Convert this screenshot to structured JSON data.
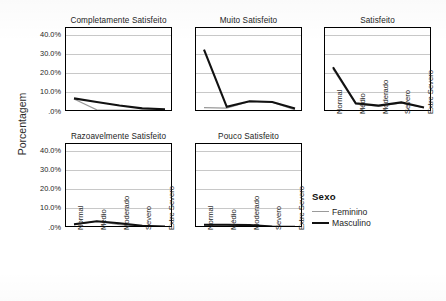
{
  "top_artifact": {
    "left_fragment": "",
    "right_fragment": ""
  },
  "axis": {
    "y_title": "Porcentagem",
    "y_ticks": [
      "40.0%",
      "30.0%",
      "20.0%",
      "10.0%",
      ".0%"
    ],
    "x_categories": [
      "Normal",
      "Médio",
      "Moderado",
      "Severo",
      "Extre Severo"
    ]
  },
  "legend": {
    "title": "Sexo",
    "items": [
      {
        "label": "Feminino",
        "color": "#9a9a9a",
        "width": 1.2
      },
      {
        "label": "Masculino",
        "color": "#111111",
        "width": 2.1
      }
    ]
  },
  "chart_data": {
    "type": "line",
    "title": "",
    "subtitle": "",
    "xlabel": "",
    "ylabel": "Porcentagem",
    "ylim": [
      0,
      44
    ],
    "y_ticks": [
      0,
      10,
      20,
      30,
      40
    ],
    "y_tick_labels": [
      ".0%",
      "10.0%",
      "20.0%",
      "30.0%",
      "40.0%"
    ],
    "grid": true,
    "legend_position": "right",
    "legend_title": "Sexo",
    "categories": [
      "Normal",
      "Médio",
      "Moderado",
      "Severo",
      "Extre Severo"
    ],
    "facet_layout": {
      "rows": 2,
      "cols": 3
    },
    "facets": [
      {
        "title": "Completamente Satisfeito",
        "series": [
          {
            "name": "Feminino",
            "values": [
              6.3,
              0.6,
              0.5,
              0.4,
              0.4
            ]
          },
          {
            "name": "Masculino",
            "values": [
              6.6,
              4.7,
              2.9,
              1.4,
              0.9
            ]
          }
        ]
      },
      {
        "title": "Muito Satisfeito",
        "series": [
          {
            "name": "Feminino",
            "values": [
              1.8,
              1.5,
              5.0,
              4.6,
              0.6
            ]
          },
          {
            "name": "Masculino",
            "values": [
              32.2,
              2.2,
              5.1,
              4.7,
              1.3
            ]
          }
        ]
      },
      {
        "title": "Satisfeito",
        "series": [
          {
            "name": "Feminino",
            "values": [
              22.1,
              3.6,
              2.6,
              4.3,
              1.8
            ]
          },
          {
            "name": "Masculino",
            "values": [
              22.9,
              4.0,
              2.8,
              4.5,
              1.8
            ]
          }
        ]
      },
      {
        "title": "Razoavelmente Satisfeito",
        "series": [
          {
            "name": "Feminino",
            "values": [
              1.1,
              3.0,
              1.2,
              0.4,
              0.2
            ]
          },
          {
            "name": "Masculino",
            "values": [
              1.4,
              3.0,
              2.0,
              0.6,
              0.3
            ]
          }
        ]
      },
      {
        "title": "Pouco Satisfeito",
        "series": [
          {
            "name": "Feminino",
            "values": [
              1.0,
              1.0,
              0.9,
              0.2,
              0.1
            ]
          },
          {
            "name": "Masculino",
            "values": [
              1.2,
              1.2,
              1.0,
              0.3,
              0.1
            ]
          }
        ]
      }
    ]
  }
}
